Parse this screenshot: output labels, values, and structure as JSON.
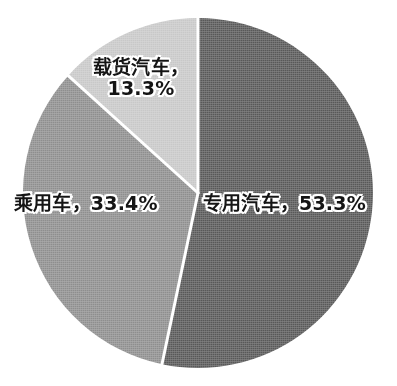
{
  "background_color": "#ffffff",
  "chart_data": {
    "type": "pie",
    "title": "",
    "subtitle": "",
    "xlabel": "",
    "ylabel": "",
    "legend_position": "none",
    "grid": false,
    "label_format": "{name}，{value}%",
    "start_angle_deg": 0,
    "direction": "clockwise",
    "center": {
      "x": 198,
      "y": 193
    },
    "radius": 175,
    "separator_color": "#ffffff",
    "separator_width": 3,
    "categories": [
      "专用汽车",
      "乘用车",
      "载货汽车"
    ],
    "values": [
      53.3,
      33.4,
      13.3
    ],
    "colors": [
      "#585858",
      "#8e8e8e",
      "#c8c8c8"
    ],
    "slices": [
      {
        "name": "专用汽车",
        "value": 53.3,
        "value_text": "53.3%",
        "label": "专用汽车，53.3%",
        "color": "#585858",
        "start_deg": 0,
        "end_deg": 191.88
      },
      {
        "name": "乘用车",
        "value": 33.4,
        "value_text": "33.4%",
        "label": "乘用车，33.4%",
        "color": "#8e8e8e",
        "start_deg": 191.88,
        "end_deg": 312.12
      },
      {
        "name": "载货汽车",
        "value": 13.3,
        "value_text": "13.3%",
        "label": "载货汽车，\n13.3%",
        "color": "#c8c8c8",
        "start_deg": 312.12,
        "end_deg": 360
      }
    ]
  },
  "labels": {
    "special_vehicle": "专用汽车，53.3%",
    "passenger_car": "乘用车，33.4%",
    "cargo_truck": "载货汽车，\n13.3%"
  }
}
